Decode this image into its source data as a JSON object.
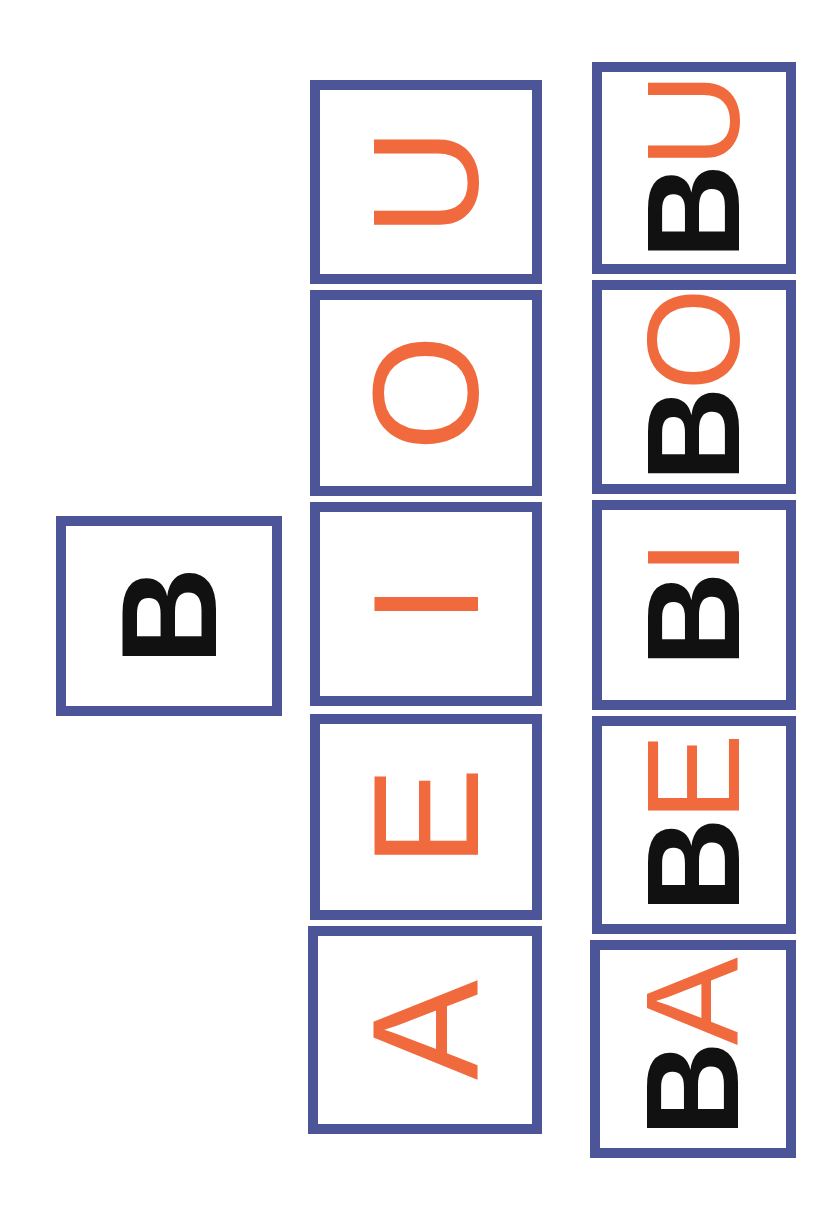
{
  "colors": {
    "frame": "#4b5597",
    "consonant": "#111111",
    "vowel": "#f06a3e",
    "background": "#ffffff"
  },
  "consonant_card": {
    "letter": "B"
  },
  "vowel_cards": [
    {
      "letter": "A"
    },
    {
      "letter": "E"
    },
    {
      "letter": "I"
    },
    {
      "letter": "O"
    },
    {
      "letter": "U"
    }
  ],
  "syllable_cards": [
    {
      "consonant": "B",
      "vowel": "A"
    },
    {
      "consonant": "B",
      "vowel": "E"
    },
    {
      "consonant": "B",
      "vowel": "I"
    },
    {
      "consonant": "B",
      "vowel": "O"
    },
    {
      "consonant": "B",
      "vowel": "U"
    }
  ]
}
